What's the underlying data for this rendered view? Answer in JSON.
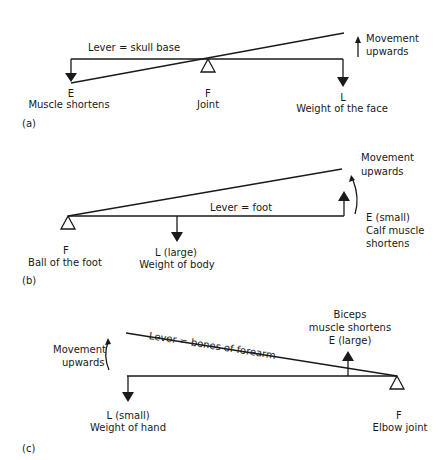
{
  "panels": [
    {
      "id": "a",
      "tag": "(a)",
      "lever_label": "Lever = skull base",
      "effort_letter": "E",
      "effort_desc": "Muscle shortens",
      "fulcrum_letter": "F",
      "fulcrum_desc": "Joint",
      "load_letter": "L",
      "load_desc": "Weight of the face",
      "movement_line1": "Movement",
      "movement_line2": "upwards"
    },
    {
      "id": "b",
      "tag": "(b)",
      "lever_label": "Lever = foot",
      "fulcrum_letter": "F",
      "fulcrum_desc": "Ball of the foot",
      "load_letter": "L (large)",
      "load_desc": "Weight of body",
      "effort_letter": "E (small)",
      "effort_desc1": "Calf muscle",
      "effort_desc2": "shortens",
      "movement_line1": "Movement",
      "movement_line2": "upwards"
    },
    {
      "id": "c",
      "tag": "(c)",
      "lever_label": "Lever = bones of forearm",
      "movement_line1": "Movement",
      "movement_line2": "upwards",
      "load_letter": "L (small)",
      "load_desc": "Weight of hand",
      "effort_line1": "Biceps",
      "effort_line2": "muscle shortens",
      "effort_letter": "E (large)",
      "fulcrum_letter": "F",
      "fulcrum_desc": "Elbow joint"
    }
  ],
  "colors": {
    "ink": "#1a1a1a",
    "background": "#ffffff"
  }
}
